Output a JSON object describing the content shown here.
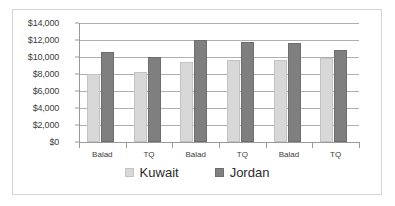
{
  "chart_data": {
    "type": "bar",
    "title": "",
    "xlabel": "",
    "ylabel": "",
    "ylim": [
      0,
      14000
    ],
    "ytick_labels": [
      "$14,000",
      "$12,000",
      "$10,000",
      "$8,000",
      "$6,000",
      "$4,000",
      "$2,000",
      "$0"
    ],
    "ytick_values": [
      14000,
      12000,
      10000,
      8000,
      6000,
      4000,
      2000,
      0
    ],
    "grid": true,
    "legend_position": "bottom",
    "categories": [
      "Balad",
      "TQ",
      "Balad",
      "TQ",
      "Balad",
      "TQ"
    ],
    "groups": [
      {
        "labels": [
          "Balad",
          "TQ"
        ]
      },
      {
        "labels": [
          "Balad",
          "TQ"
        ]
      },
      {
        "labels": [
          "Balad",
          "TQ"
        ]
      }
    ],
    "series": [
      {
        "name": "Kuwait",
        "color": "#d8d8d8",
        "values": [
          8000,
          8250,
          9400,
          9700,
          9600,
          9900
        ]
      },
      {
        "name": "Jordan",
        "color": "#7f7f7f",
        "values": [
          10600,
          10000,
          12000,
          11800,
          11600,
          10800
        ]
      }
    ]
  },
  "legend": {
    "items": [
      {
        "label": "Kuwait",
        "series": "kuwait"
      },
      {
        "label": "Jordan",
        "series": "jordan"
      }
    ]
  }
}
